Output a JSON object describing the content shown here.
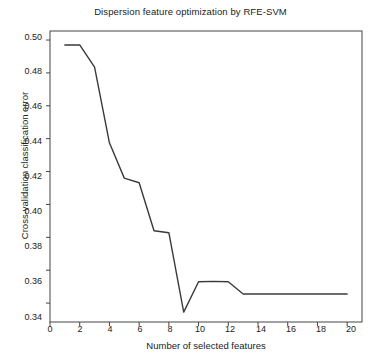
{
  "chart_data": {
    "type": "line",
    "title": "Dispersion feature optimization by RFE-SVM",
    "xlabel": "Number of selected features",
    "ylabel": "Cross-validation classification error",
    "x": [
      1,
      2,
      3,
      4,
      5,
      6,
      7,
      8,
      9,
      10,
      11,
      12,
      13,
      14,
      15,
      16,
      17,
      18,
      19,
      20
    ],
    "values": [
      0.497,
      0.497,
      0.4835,
      0.4375,
      0.416,
      0.4132,
      0.384,
      0.3828,
      0.3345,
      0.353,
      0.3532,
      0.353,
      0.3455,
      0.3455,
      0.3455,
      0.3455,
      0.3455,
      0.3455,
      0.3455,
      0.3455
    ],
    "xlim": [
      0,
      21
    ],
    "ylim": [
      0.3285,
      0.5055
    ],
    "xticks": [
      0,
      2,
      4,
      6,
      8,
      10,
      12,
      14,
      16,
      18,
      20
    ],
    "xtick_labels": [
      "0",
      "2",
      "4",
      "6",
      "8",
      "10",
      "12",
      "14",
      "16",
      "18",
      "20"
    ],
    "yticks": [
      0.34,
      0.36,
      0.38,
      0.4,
      0.42,
      0.44,
      0.46,
      0.48,
      0.5
    ],
    "ytick_labels": [
      "0.34",
      "0.36",
      "0.38",
      "0.40",
      "0.42",
      "0.44",
      "0.46",
      "0.48",
      "0.50"
    ],
    "grid": false,
    "legend": null,
    "line_color": "#3a3a3a",
    "axis_color": "#444444",
    "background": "#ffffff",
    "minimum": {
      "x": 9,
      "y": 0.3345
    }
  }
}
